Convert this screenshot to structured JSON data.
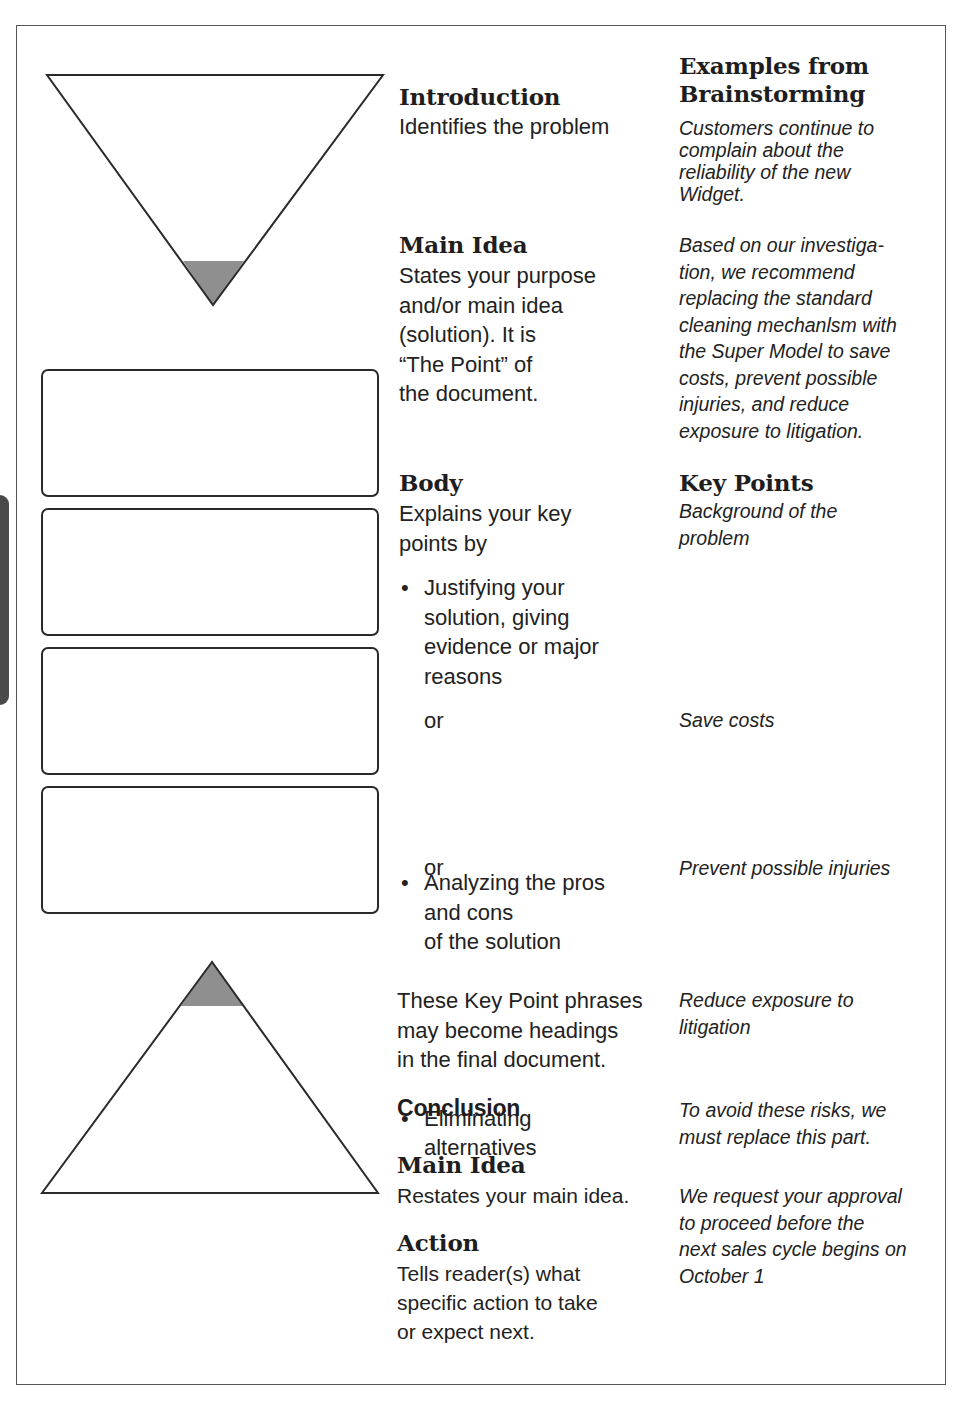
{
  "left_column": {
    "top_shape": "inverted-triangle",
    "top_shape_shaded": "apex (main idea)",
    "boxes_count": 4,
    "bottom_shape": "upright-triangle",
    "bottom_shape_shaded": "apex (main idea)"
  },
  "colors": {
    "shade": "#8f8f8f",
    "stroke": "#2a2a2a",
    "frame": "#555555",
    "tab": "#4a4a4a"
  },
  "middle_column": {
    "introduction": {
      "heading": "Introduction",
      "text": "Identifies the problem"
    },
    "main_idea": {
      "heading": "Main Idea",
      "lines": [
        "States your purpose",
        "and/or main idea",
        "(solution). It is",
        "“The Point” of",
        "the document."
      ]
    },
    "body": {
      "heading": "Body",
      "lines": [
        "Explains your key",
        "points by"
      ],
      "bullet_1": [
        "Justifying your",
        "solution, giving",
        "evidence or major",
        "reasons"
      ],
      "or_1": "or",
      "bullet_2": [
        "Analyzing the pros",
        "and cons",
        "of the solution"
      ],
      "or_2": "or",
      "bullet_3": [
        "Eliminating",
        "alternatives"
      ],
      "note": [
        "These Key Point phrases",
        "may become headings",
        "in the final document."
      ]
    },
    "conclusion": {
      "heading": "Conclusion",
      "main_idea_heading": "Main Idea",
      "main_idea_text": "Restates your main idea.",
      "action_heading": "Action",
      "action_lines": [
        "Tells reader(s) what",
        "specific action to take",
        "or expect next."
      ]
    }
  },
  "right_column": {
    "heading_lines": [
      "Examples from",
      "Brainstorming"
    ],
    "intro_example": [
      "Customers continue to",
      "complain about the",
      "reliability of the new",
      "Widget."
    ],
    "main_idea_example": [
      "Based on our investiga-",
      "tion, we recommend",
      "replacing the standard",
      "cleaning mechanlsm with",
      "the Super Model to save",
      "costs, prevent possible",
      "injuries, and reduce",
      "exposure to litigation."
    ],
    "key_points_heading": "Key Points",
    "key_points": [
      [
        "Background of the",
        "problem"
      ],
      [
        "Save costs"
      ],
      [
        "Prevent possible injuries"
      ],
      [
        "Reduce exposure to",
        "litigation"
      ]
    ],
    "conclusion_example": [
      "To avoid these risks, we",
      "must replace this part."
    ],
    "action_example": [
      "We request your approval",
      "to proceed before the",
      "next sales cycle begins on",
      "October 1"
    ]
  }
}
